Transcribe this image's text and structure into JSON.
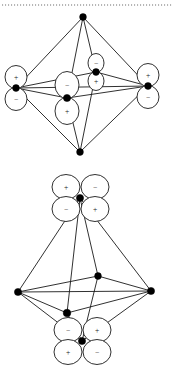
{
  "page": {
    "background_color": "#ffffff",
    "line_color": "#1a1a1a",
    "dot_color": "#000000",
    "lobe_fill": "#ffffff",
    "rule_color": "#6e6e6e"
  },
  "top_rule": {
    "name": "dotted-divider",
    "style": "dotted",
    "y": 5,
    "x_start": 2,
    "x_end": 172
  },
  "figures": [
    {
      "id": "figure-top",
      "caption": "",
      "orbital_type": "p",
      "description": "Octahedron with p-type dumbbell orbitals on four equatorial vertices",
      "vertices": [
        {
          "name": "apex-top",
          "x": 83,
          "y": 17,
          "orbital": "none"
        },
        {
          "name": "apex-bottom",
          "x": 80,
          "y": 152,
          "orbital": "none"
        },
        {
          "name": "equatorial-left",
          "x": 16,
          "y": 88,
          "orbital": "p-vertical",
          "upper_sign": "+",
          "lower_sign": "−"
        },
        {
          "name": "equatorial-right",
          "x": 148,
          "y": 86,
          "orbital": "p-vertical",
          "upper_sign": "+",
          "lower_sign": "−"
        },
        {
          "name": "equatorial-front",
          "x": 67,
          "y": 98,
          "orbital": "p-vertical",
          "upper_sign": "−",
          "lower_sign": "+"
        },
        {
          "name": "equatorial-back",
          "x": 96,
          "y": 72,
          "orbital": "p-vertical",
          "upper_sign": "−",
          "lower_sign": "+"
        }
      ],
      "signs": [
        "+",
        "−",
        "+",
        "−",
        "−",
        "+",
        "−",
        "+"
      ]
    },
    {
      "id": "figure-bottom",
      "caption": "",
      "orbital_type": "d",
      "description": "Octahedron with d-type cloverleaf orbitals on the two axial vertices",
      "vertices": [
        {
          "name": "apex-top",
          "x": 80,
          "y": 198,
          "orbital": "d-cloverleaf",
          "quadrant_signs": {
            "upper_left": "+",
            "upper_right": "−",
            "lower_left": "−",
            "lower_right": "+"
          }
        },
        {
          "name": "apex-bottom",
          "x": 82,
          "y": 341,
          "orbital": "d-cloverleaf",
          "quadrant_signs": {
            "upper_left": "−",
            "upper_right": "+",
            "lower_left": "+",
            "lower_right": "−"
          }
        },
        {
          "name": "equatorial-left",
          "x": 18,
          "y": 292,
          "orbital": "none"
        },
        {
          "name": "equatorial-right",
          "x": 151,
          "y": 291,
          "orbital": "none"
        },
        {
          "name": "equatorial-front",
          "x": 67,
          "y": 313,
          "orbital": "none"
        },
        {
          "name": "equatorial-back",
          "x": 98,
          "y": 276,
          "orbital": "none"
        }
      ],
      "signs": [
        "+",
        "−",
        "−",
        "+",
        "−",
        "+",
        "+",
        "−"
      ]
    }
  ]
}
